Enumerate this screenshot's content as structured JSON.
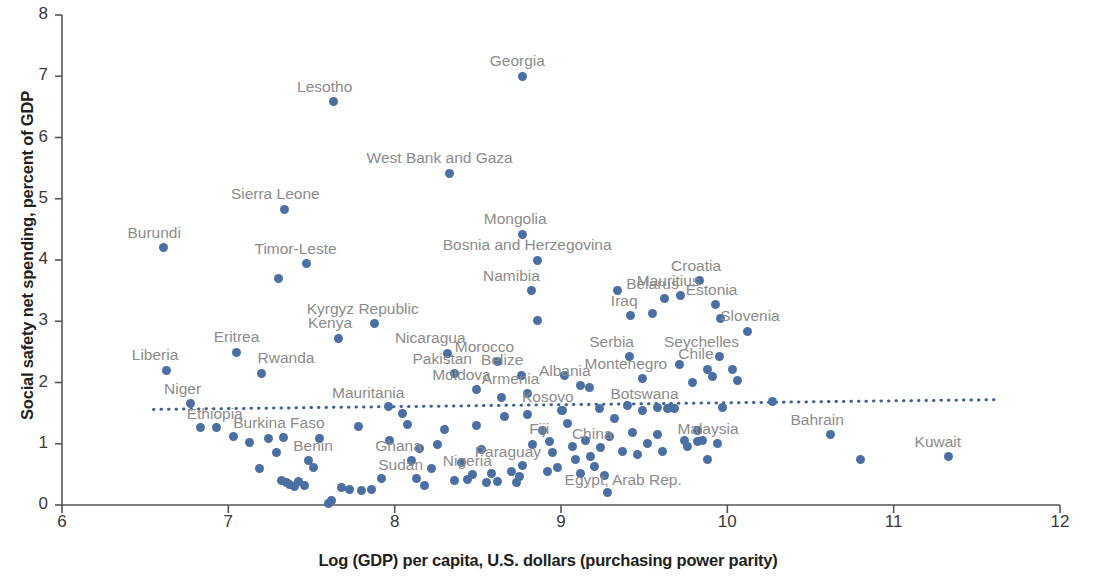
{
  "chart_data": {
    "type": "scatter",
    "title": "",
    "xlabel": "Log (GDP) per capita, U.S. dollars (purchasing power parity)",
    "ylabel": "Social safety net spending, percent of GDP",
    "xlim": [
      6,
      12
    ],
    "ylim": [
      0,
      8
    ],
    "xticks": [
      "6",
      "7",
      "8",
      "9",
      "10",
      "11",
      "12"
    ],
    "yticks": [
      "0",
      "1",
      "2",
      "3",
      "4",
      "5",
      "6",
      "7",
      "8"
    ],
    "grid": false,
    "legend": null,
    "point_color": "#4c6fa3",
    "trendline": {
      "style": "dotted",
      "color": "#3f5f96",
      "x_start": 6.55,
      "y_start": 1.56,
      "x_end": 11.63,
      "y_end": 1.72
    },
    "labeled_points": [
      {
        "label": "Burundi",
        "x": 6.61,
        "y": 4.2,
        "lx": -36,
        "ly": -24
      },
      {
        "label": "Lesotho",
        "x": 7.63,
        "y": 6.58,
        "lx": -36,
        "ly": -24
      },
      {
        "label": "Georgia",
        "x": 8.77,
        "y": 7.0,
        "lx": -33,
        "ly": -24
      },
      {
        "label": "West Bank and Gaza",
        "x": 8.33,
        "y": 5.42,
        "lx": -83,
        "ly": -24
      },
      {
        "label": "Sierra Leone",
        "x": 7.34,
        "y": 4.83,
        "lx": -54,
        "ly": -24
      },
      {
        "label": "Timor-Leste",
        "x": 7.47,
        "y": 3.94,
        "lx": -52,
        "ly": -24
      },
      {
        "label": "Mongolia",
        "x": 8.77,
        "y": 4.42,
        "lx": -39,
        "ly": -24
      },
      {
        "label": "Bosnia and Herzegovina",
        "x": 8.86,
        "y": 4.0,
        "lx": -95,
        "ly": -24
      },
      {
        "label": "Croatia",
        "x": 9.83,
        "y": 3.66,
        "lx": -28,
        "ly": -24
      },
      {
        "label": "Mauritius",
        "x": 9.72,
        "y": 3.42,
        "lx": -44,
        "ly": -24
      },
      {
        "label": "Kyrgyz Republic",
        "x": 7.88,
        "y": 2.96,
        "lx": -68,
        "ly": -24
      },
      {
        "label": "Kenya",
        "x": 7.66,
        "y": 2.72,
        "lx": -30,
        "ly": -24
      },
      {
        "label": "Namibia",
        "x": 8.82,
        "y": 3.5,
        "lx": -48,
        "ly": -24
      },
      {
        "label": "Belarus",
        "x": 9.62,
        "y": 3.37,
        "lx": -38,
        "ly": -24
      },
      {
        "label": "Estonia",
        "x": 9.93,
        "y": 3.27,
        "lx": -30,
        "ly": -24
      },
      {
        "label": "Slovenia",
        "x": 10.12,
        "y": 2.84,
        "lx": -27,
        "ly": -24
      },
      {
        "label": "Iraq",
        "x": 9.42,
        "y": 3.09,
        "lx": -20,
        "ly": -24
      },
      {
        "label": "Eritrea",
        "x": 7.05,
        "y": 2.49,
        "lx": -23,
        "ly": -24
      },
      {
        "label": "Rwanda",
        "x": 7.2,
        "y": 2.15,
        "lx": -4,
        "ly": -24
      },
      {
        "label": "Liberia",
        "x": 6.63,
        "y": 2.2,
        "lx": -35,
        "ly": -24
      },
      {
        "label": "Niger",
        "x": 6.77,
        "y": 1.65,
        "lx": -26,
        "ly": -24
      },
      {
        "label": "Nicaragua",
        "x": 8.32,
        "y": 2.48,
        "lx": -53,
        "ly": -24
      },
      {
        "label": "Morocco",
        "x": 8.62,
        "y": 2.34,
        "lx": -43,
        "ly": -24
      },
      {
        "label": "Seychelles",
        "x": 9.95,
        "y": 2.42,
        "lx": -55,
        "ly": -24
      },
      {
        "label": "Chile",
        "x": 9.88,
        "y": 2.22,
        "lx": -29,
        "ly": -24
      },
      {
        "label": "Serbia",
        "x": 9.41,
        "y": 2.42,
        "lx": -40,
        "ly": -24
      },
      {
        "label": "Pakistan",
        "x": 8.36,
        "y": 2.14,
        "lx": -42,
        "ly": -24
      },
      {
        "label": "Belize",
        "x": 8.76,
        "y": 2.12,
        "lx": -40,
        "ly": -24
      },
      {
        "label": "Montenegro",
        "x": 9.49,
        "y": 2.06,
        "lx": -58,
        "ly": -24
      },
      {
        "label": "Moldova",
        "x": 8.49,
        "y": 1.88,
        "lx": -44,
        "ly": -24
      },
      {
        "label": "Armenia",
        "x": 8.8,
        "y": 1.82,
        "lx": -46,
        "ly": -24
      },
      {
        "label": "Albania",
        "x": 9.12,
        "y": 1.95,
        "lx": -42,
        "ly": -24
      },
      {
        "label": "Mauritania",
        "x": 7.96,
        "y": 1.61,
        "lx": -56,
        "ly": -22
      },
      {
        "label": "Ethiopia",
        "x": 6.93,
        "y": 1.27,
        "lx": -30,
        "ly": -22
      },
      {
        "label": "Kosovo",
        "x": 9.0,
        "y": 1.55,
        "lx": -39,
        "ly": -22
      },
      {
        "label": "Botswana",
        "x": 9.58,
        "y": 1.6,
        "lx": -47,
        "ly": -22
      },
      {
        "label": "Bahrain",
        "x": 10.62,
        "y": 1.15,
        "lx": -40,
        "ly": -24
      },
      {
        "label": "Kuwait",
        "x": 11.33,
        "y": 0.79,
        "lx": -34,
        "ly": -24
      },
      {
        "label": "Burkina Faso",
        "x": 7.33,
        "y": 1.1,
        "lx": -50,
        "ly": -24
      },
      {
        "label": "Benin",
        "x": 7.48,
        "y": 0.72,
        "lx": -15,
        "ly": -24
      },
      {
        "label": "Ghana",
        "x": 8.1,
        "y": 0.72,
        "lx": -36,
        "ly": -24
      },
      {
        "label": "Sudan",
        "x": 8.13,
        "y": 0.44,
        "lx": -38,
        "ly": -22
      },
      {
        "label": "Nigeria",
        "x": 8.47,
        "y": 0.5,
        "lx": -30,
        "ly": -22
      },
      {
        "label": "Paraguay",
        "x": 8.77,
        "y": 0.65,
        "lx": -48,
        "ly": -22
      },
      {
        "label": "Fiji",
        "x": 8.93,
        "y": 1.03,
        "lx": -20,
        "ly": -22
      },
      {
        "label": "China",
        "x": 9.24,
        "y": 0.94,
        "lx": -29,
        "ly": -22
      },
      {
        "label": "Egypt, Arab Rep.",
        "x": 9.28,
        "y": 0.2,
        "lx": -43,
        "ly": -22
      },
      {
        "label": "Malaysia",
        "x": 9.82,
        "y": 1.03,
        "lx": -20,
        "ly": -22
      }
    ],
    "unlabeled_points": [
      {
        "x": 6.83,
        "y": 1.27
      },
      {
        "x": 7.03,
        "y": 1.12
      },
      {
        "x": 7.13,
        "y": 1.02
      },
      {
        "x": 7.19,
        "y": 0.6
      },
      {
        "x": 7.24,
        "y": 1.08
      },
      {
        "x": 7.29,
        "y": 0.85
      },
      {
        "x": 7.32,
        "y": 0.4
      },
      {
        "x": 7.35,
        "y": 0.36
      },
      {
        "x": 7.37,
        "y": 0.33
      },
      {
        "x": 7.4,
        "y": 0.3
      },
      {
        "x": 7.42,
        "y": 0.38
      },
      {
        "x": 7.3,
        "y": 3.7
      },
      {
        "x": 7.46,
        "y": 0.32
      },
      {
        "x": 7.51,
        "y": 0.62
      },
      {
        "x": 7.55,
        "y": 1.08
      },
      {
        "x": 7.6,
        "y": 0.03
      },
      {
        "x": 7.62,
        "y": 0.07
      },
      {
        "x": 7.68,
        "y": 0.28
      },
      {
        "x": 7.73,
        "y": 0.25
      },
      {
        "x": 7.78,
        "y": 1.28
      },
      {
        "x": 7.8,
        "y": 0.23
      },
      {
        "x": 7.86,
        "y": 0.26
      },
      {
        "x": 7.92,
        "y": 0.43
      },
      {
        "x": 7.97,
        "y": 1.05
      },
      {
        "x": 8.05,
        "y": 1.5
      },
      {
        "x": 8.08,
        "y": 1.32
      },
      {
        "x": 8.15,
        "y": 0.92
      },
      {
        "x": 8.18,
        "y": 0.32
      },
      {
        "x": 8.22,
        "y": 0.6
      },
      {
        "x": 8.26,
        "y": 0.98
      },
      {
        "x": 8.3,
        "y": 1.23
      },
      {
        "x": 8.36,
        "y": 0.4
      },
      {
        "x": 8.4,
        "y": 0.7
      },
      {
        "x": 8.44,
        "y": 0.42
      },
      {
        "x": 8.49,
        "y": 1.3
      },
      {
        "x": 8.52,
        "y": 0.9
      },
      {
        "x": 8.55,
        "y": 0.36
      },
      {
        "x": 8.58,
        "y": 0.52
      },
      {
        "x": 8.62,
        "y": 0.38
      },
      {
        "x": 8.66,
        "y": 1.44
      },
      {
        "x": 8.7,
        "y": 0.55
      },
      {
        "x": 8.73,
        "y": 0.36
      },
      {
        "x": 8.75,
        "y": 0.46
      },
      {
        "x": 8.8,
        "y": 1.48
      },
      {
        "x": 8.83,
        "y": 0.98
      },
      {
        "x": 8.86,
        "y": 3.02
      },
      {
        "x": 8.89,
        "y": 1.22
      },
      {
        "x": 8.92,
        "y": 0.55
      },
      {
        "x": 8.95,
        "y": 0.85
      },
      {
        "x": 8.98,
        "y": 0.62
      },
      {
        "x": 9.01,
        "y": 1.55
      },
      {
        "x": 9.04,
        "y": 1.33
      },
      {
        "x": 9.07,
        "y": 0.95
      },
      {
        "x": 9.09,
        "y": 0.75
      },
      {
        "x": 9.12,
        "y": 0.52
      },
      {
        "x": 9.15,
        "y": 1.05
      },
      {
        "x": 9.18,
        "y": 0.8
      },
      {
        "x": 9.2,
        "y": 0.63
      },
      {
        "x": 9.23,
        "y": 1.58
      },
      {
        "x": 9.26,
        "y": 0.48
      },
      {
        "x": 9.29,
        "y": 1.12
      },
      {
        "x": 9.32,
        "y": 1.42
      },
      {
        "x": 9.34,
        "y": 3.5
      },
      {
        "x": 9.37,
        "y": 0.88
      },
      {
        "x": 9.4,
        "y": 1.62
      },
      {
        "x": 9.43,
        "y": 1.18
      },
      {
        "x": 9.46,
        "y": 0.82
      },
      {
        "x": 9.49,
        "y": 1.55
      },
      {
        "x": 9.52,
        "y": 1.0
      },
      {
        "x": 9.55,
        "y": 3.12
      },
      {
        "x": 9.58,
        "y": 1.15
      },
      {
        "x": 9.61,
        "y": 0.88
      },
      {
        "x": 9.64,
        "y": 1.58
      },
      {
        "x": 9.66,
        "y": 1.59
      },
      {
        "x": 9.68,
        "y": 1.58
      },
      {
        "x": 9.71,
        "y": 2.3
      },
      {
        "x": 9.74,
        "y": 1.05
      },
      {
        "x": 9.76,
        "y": 0.95
      },
      {
        "x": 9.79,
        "y": 2.0
      },
      {
        "x": 9.82,
        "y": 1.22
      },
      {
        "x": 9.85,
        "y": 1.05
      },
      {
        "x": 9.88,
        "y": 0.75
      },
      {
        "x": 9.91,
        "y": 2.1
      },
      {
        "x": 9.94,
        "y": 1.0
      },
      {
        "x": 9.97,
        "y": 1.6
      },
      {
        "x": 10.03,
        "y": 2.22
      },
      {
        "x": 10.06,
        "y": 2.03
      },
      {
        "x": 10.27,
        "y": 1.69
      },
      {
        "x": 10.8,
        "y": 0.74
      },
      {
        "x": 9.96,
        "y": 3.05
      },
      {
        "x": 9.17,
        "y": 1.92
      },
      {
        "x": 8.64,
        "y": 1.75
      },
      {
        "x": 9.02,
        "y": 2.12
      }
    ]
  }
}
